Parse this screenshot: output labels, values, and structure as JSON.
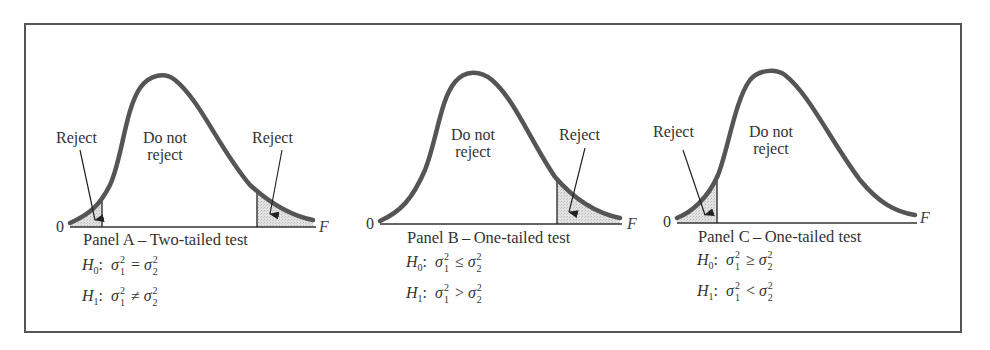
{
  "figure": {
    "axis_zero_label": "0",
    "axis_var_label": "F",
    "colors": {
      "curve": "#555555",
      "shading": "#d9d9d9",
      "frame": "#555555",
      "text": "#333333"
    }
  },
  "panels": [
    {
      "id": "A",
      "caption": "Panel A – Two-tailed test",
      "region_labels": {
        "reject_left": "Reject",
        "do_not_reject_line1": "Do not",
        "do_not_reject_line2": "reject",
        "reject_right": "Reject"
      },
      "h0": {
        "label": "H",
        "sub": "0",
        "lhs": "σ",
        "relation": "=",
        "rhs": "σ"
      },
      "h1": {
        "label": "H",
        "sub": "1",
        "lhs": "σ",
        "relation": "≠",
        "rhs": "σ"
      },
      "rejection_regions": [
        "left tail",
        "right tail"
      ]
    },
    {
      "id": "B",
      "caption": "Panel B – One-tailed test",
      "region_labels": {
        "do_not_reject_line1": "Do not",
        "do_not_reject_line2": "reject",
        "reject_right": "Reject"
      },
      "h0": {
        "label": "H",
        "sub": "0",
        "lhs": "σ",
        "relation": "≤",
        "rhs": "σ"
      },
      "h1": {
        "label": "H",
        "sub": "1",
        "lhs": "σ",
        "relation": ">",
        "rhs": "σ"
      },
      "rejection_regions": [
        "right tail"
      ]
    },
    {
      "id": "C",
      "caption": "Panel C – One-tailed test",
      "region_labels": {
        "reject_left": "Reject",
        "do_not_reject_line1": "Do not",
        "do_not_reject_line2": "reject"
      },
      "h0": {
        "label": "H",
        "sub": "0",
        "lhs": "σ",
        "relation": "≥",
        "rhs": "σ"
      },
      "h1": {
        "label": "H",
        "sub": "1",
        "lhs": "σ",
        "relation": "<",
        "rhs": "σ"
      },
      "rejection_regions": [
        "left tail"
      ]
    }
  ],
  "sigma_indices": {
    "sup": "2",
    "sub1": "1",
    "sub2": "2"
  }
}
